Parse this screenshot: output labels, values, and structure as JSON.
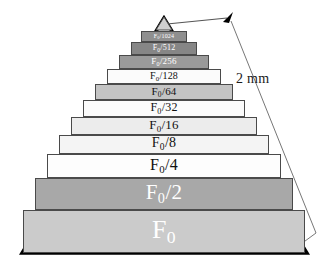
{
  "figure": {
    "background_color": "#ffffff",
    "outline_color": "#000000",
    "tier_border_color": "#4a4a4a"
  },
  "annotation": {
    "scale_text": "2 mm",
    "arrow_color": "#555555",
    "arrow_head_color": "#000000"
  },
  "chart_data": {
    "type": "bar",
    "xlabel": "",
    "ylabel": "",
    "orientation": "pyramid-stacked",
    "categories": [
      "F0",
      "F0/2",
      "F0/4",
      "F0/8",
      "F0/16",
      "F0/32",
      "F0/64",
      "F0/128",
      "F0/256",
      "F0/512",
      "F0/1024",
      "apex"
    ],
    "values": [
      1,
      0.5,
      0.25,
      0.125,
      0.0625,
      0.03125,
      0.015625,
      0.0078125,
      0.00390625,
      0.001953125,
      0.0009765625,
      0
    ],
    "annotations": [
      "2 mm"
    ],
    "tiers": [
      {
        "id": "tier-apex",
        "label_main": "",
        "label_sub": "",
        "label_rest": "",
        "fill": "#d0d0d0",
        "text_color": "#000000",
        "font_size": 5,
        "shape": "triangle",
        "x": 155,
        "y": 16,
        "width": 18,
        "height": 15
      },
      {
        "id": "tier-1024",
        "label_main": "F",
        "label_sub": "0",
        "label_rest": "/1024",
        "fill": "#8f8f8f",
        "text_color": "#ffffff",
        "font_size": 6,
        "shape": "rect",
        "x": 141,
        "y": 31,
        "width": 46,
        "height": 11
      },
      {
        "id": "tier-512",
        "label_main": "F",
        "label_sub": "0",
        "label_rest": "/512",
        "fill": "#868686",
        "text_color": "#ffffff",
        "font_size": 8,
        "shape": "rect",
        "x": 131,
        "y": 42,
        "width": 66,
        "height": 13
      },
      {
        "id": "tier-256",
        "label_main": "F",
        "label_sub": "0",
        "label_rest": "/256",
        "fill": "#9a9a9a",
        "text_color": "#ffffff",
        "font_size": 9,
        "shape": "rect",
        "x": 119,
        "y": 55,
        "width": 90,
        "height": 14
      },
      {
        "id": "tier-128",
        "label_main": "F",
        "label_sub": "0",
        "label_rest": "/128",
        "fill": "#fbfbfb",
        "text_color": "#111111",
        "font_size": 10,
        "shape": "rect",
        "x": 107,
        "y": 69,
        "width": 114,
        "height": 15
      },
      {
        "id": "tier-64",
        "label_main": "F",
        "label_sub": "0",
        "label_rest": "/64",
        "fill": "#c4c4c4",
        "text_color": "#111111",
        "font_size": 11,
        "shape": "rect",
        "x": 95,
        "y": 84,
        "width": 138,
        "height": 16
      },
      {
        "id": "tier-32",
        "label_main": "F",
        "label_sub": "0",
        "label_rest": "/32",
        "fill": "#fbfbfb",
        "text_color": "#111111",
        "font_size": 12,
        "shape": "rect",
        "x": 83,
        "y": 100,
        "width": 162,
        "height": 17
      },
      {
        "id": "tier-16",
        "label_main": "F",
        "label_sub": "0",
        "label_rest": "/16",
        "fill": "#ececec",
        "text_color": "#111111",
        "font_size": 13,
        "shape": "rect",
        "x": 71,
        "y": 117,
        "width": 186,
        "height": 18
      },
      {
        "id": "tier-8",
        "label_main": "F",
        "label_sub": "0",
        "label_rest": "/8",
        "fill": "#f4f4f4",
        "text_color": "#111111",
        "font_size": 14,
        "shape": "rect",
        "x": 59,
        "y": 135,
        "width": 210,
        "height": 19
      },
      {
        "id": "tier-4",
        "label_main": "F",
        "label_sub": "0",
        "label_rest": "/4",
        "fill": "#fdfdfd",
        "text_color": "#111111",
        "font_size": 16,
        "shape": "rect",
        "x": 47,
        "y": 154,
        "width": 234,
        "height": 24
      },
      {
        "id": "tier-2",
        "label_main": "F",
        "label_sub": "0",
        "label_rest": "/2",
        "fill": "#a8a8a8",
        "text_color": "#ffffff",
        "font_size": 21,
        "shape": "rect",
        "x": 35,
        "y": 178,
        "width": 258,
        "height": 32
      },
      {
        "id": "tier-base",
        "label_main": "F",
        "label_sub": "0",
        "label_rest": "",
        "fill": "#cbcbcb",
        "text_color": "#ffffff",
        "font_size": 26,
        "shape": "rect",
        "x": 23,
        "y": 210,
        "width": 282,
        "height": 43
      }
    ]
  }
}
